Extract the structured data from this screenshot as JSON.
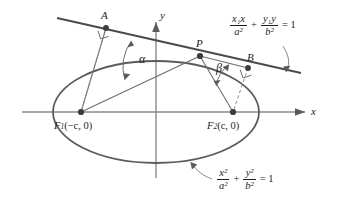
{
  "figure": {
    "type": "geometry-diagram",
    "background": "#ffffff",
    "stroke_color": "#5b5b5b",
    "axis_color": "#8a8a8a"
  },
  "axes": {
    "x_label": "x",
    "y_label": "y"
  },
  "points": {
    "A": "A",
    "B": "B",
    "P": "P",
    "F1": {
      "name": "F",
      "sub": "1",
      "coords": "(−c, 0)"
    },
    "F2": {
      "name": "F",
      "sub": "2",
      "coords": "(c, 0)"
    }
  },
  "angles": {
    "alpha": "α",
    "beta": "β"
  },
  "equations": {
    "tangent": {
      "num1": "x₁x",
      "den1": "a²",
      "plus": "+",
      "num2": "y₁y",
      "den2": "b²",
      "equals": "= 1"
    },
    "ellipse": {
      "num1": "x²",
      "den1": "a²",
      "plus": "+",
      "num2": "y²",
      "den2": "b²",
      "equals": "= 1"
    }
  },
  "geometry": {
    "ellipse_center": [
      156,
      112
    ],
    "ellipse_rx": 103,
    "ellipse_ry": 51,
    "focus1": [
      81,
      112
    ],
    "focus2": [
      233,
      112
    ],
    "point_P": [
      200,
      56
    ],
    "point_A": [
      106,
      28
    ],
    "point_B": [
      248,
      68
    ]
  }
}
